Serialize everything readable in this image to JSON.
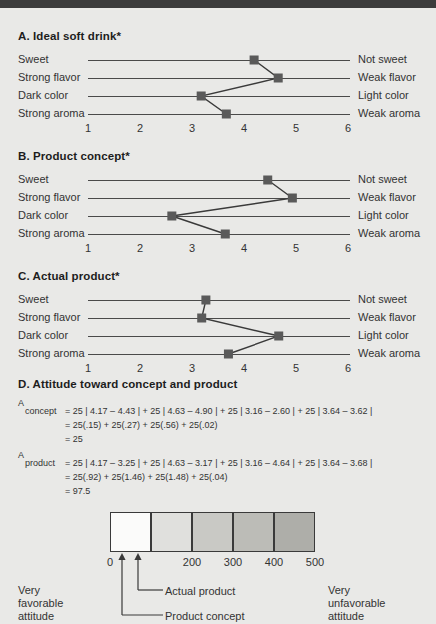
{
  "figure": {
    "background_color": "#e9e9e7",
    "marker_color": "#5a5a5a",
    "line_color": "#3a3a3a"
  },
  "sections": {
    "a": {
      "title": "A. Ideal soft drink*"
    },
    "b": {
      "title": "B. Product concept*"
    },
    "c": {
      "title": "C. Actual product*"
    },
    "d": {
      "title": "D. Attitude toward concept and product"
    }
  },
  "scale_axis": {
    "ticks": [
      "1",
      "2",
      "3",
      "4",
      "5",
      "6"
    ],
    "min": 1,
    "max": 6
  },
  "rows": {
    "left": [
      "Sweet",
      "Strong flavor",
      "Dark color",
      "Strong aroma"
    ],
    "right": [
      "Not sweet",
      "Weak flavor",
      "Light color",
      "Weak aroma"
    ]
  },
  "chart_data": [
    {
      "type": "line",
      "title": "A. Ideal soft drink*",
      "orientation": "horizontal-profile",
      "categories": [
        "Sweet",
        "Strong flavor",
        "Dark color",
        "Strong aroma"
      ],
      "right_categories": [
        "Not sweet",
        "Weak flavor",
        "Light color",
        "Weak aroma"
      ],
      "values": [
        4.17,
        4.63,
        3.16,
        3.64
      ],
      "xlabel": "",
      "ylabel": "",
      "xlim": [
        1,
        6
      ],
      "xticks": [
        "1",
        "2",
        "3",
        "4",
        "5",
        "6"
      ],
      "grid": false,
      "legend": "none"
    },
    {
      "type": "line",
      "title": "B. Product concept*",
      "orientation": "horizontal-profile",
      "categories": [
        "Sweet",
        "Strong flavor",
        "Dark color",
        "Strong aroma"
      ],
      "right_categories": [
        "Not sweet",
        "Weak flavor",
        "Light color",
        "Weak aroma"
      ],
      "values": [
        4.43,
        4.9,
        2.6,
        3.62
      ],
      "xlabel": "",
      "ylabel": "",
      "xlim": [
        1,
        6
      ],
      "xticks": [
        "1",
        "2",
        "3",
        "4",
        "5",
        "6"
      ],
      "grid": false,
      "legend": "none"
    },
    {
      "type": "line",
      "title": "C. Actual product*",
      "orientation": "horizontal-profile",
      "categories": [
        "Sweet",
        "Strong flavor",
        "Dark color",
        "Strong aroma"
      ],
      "right_categories": [
        "Not sweet",
        "Weak flavor",
        "Light color",
        "Weak aroma"
      ],
      "values": [
        3.25,
        3.17,
        4.64,
        3.68
      ],
      "xlabel": "",
      "ylabel": "",
      "xlim": [
        1,
        6
      ],
      "xticks": [
        "1",
        "2",
        "3",
        "4",
        "5",
        "6"
      ],
      "grid": false,
      "legend": "none"
    },
    {
      "type": "bar",
      "title": "Attitude scale",
      "categories": [
        "0",
        "100",
        "200",
        "300",
        "400",
        "500"
      ],
      "values": [
        100,
        100,
        100,
        100,
        100
      ],
      "segment_colors": [
        "#fbfbfa",
        "#e0e0dd",
        "#c9c9c5",
        "#bcbcb7",
        "#aeaea9"
      ],
      "xlim": [
        0,
        500
      ],
      "annotations": [
        {
          "label": "Product concept",
          "value": 25
        },
        {
          "label": "Actual product",
          "value": 97.5
        }
      ],
      "left_end_label": "Very favorable attitude",
      "right_end_label": "Very unfavorable attitude",
      "grid": false,
      "legend": "none"
    }
  ],
  "formulas": {
    "concept": {
      "symbol": "A",
      "subscript": "concept",
      "line1": "= 25 | 4.17 – 4.43 | + 25 | 4.63 – 4.90 | + 25 | 3.16 – 2.60 | + 25 | 3.64 – 3.62 |",
      "line2": "= 25(.15) + 25(.27) + 25(.56) + 25(.02)",
      "line3": "= 25"
    },
    "product": {
      "symbol": "A",
      "subscript": "product",
      "line1": "= 25 | 4.17 – 3.25 | + 25 | 4.63 – 3.17 | + 25 | 3.16 – 4.64 | + 25 | 3.64 – 3.68 |",
      "line2": "= 25(.92) + 25(1.46) + 25(1.48) + 25(.04)",
      "line3": "= 97.5"
    }
  },
  "attitude_scale": {
    "tick_labels": [
      "0",
      "100",
      "200",
      "300",
      "400",
      "500"
    ],
    "left_label_line1": "Very",
    "left_label_line2": "favorable",
    "left_label_line3": "attitude",
    "right_label_line1": "Very",
    "right_label_line2": "unfavorable",
    "right_label_line3": "attitude",
    "callout_actual": "Actual product",
    "callout_concept": "Product concept"
  }
}
